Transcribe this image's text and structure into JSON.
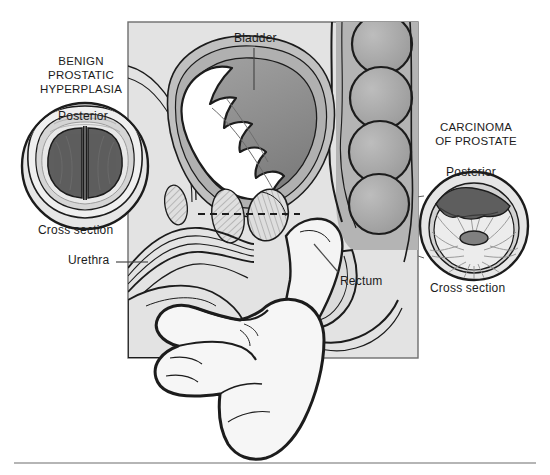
{
  "figure": {
    "background_color": "#ffffff",
    "panel_fill": "#e3e3e3",
    "panel_border_color": "#6e6e6e",
    "ink_color": "#1c1c1c",
    "tissue_mid_gray": "#a8a8a8",
    "tissue_dark_gray": "#6b6b6b",
    "lumen_white": "#ffffff",
    "hatch_gray": "#b9b9b9"
  },
  "labels": {
    "bph_title": "BENIGN\nPROSTATIC\nHYPERPLASIA",
    "carcinoma_title": "CARCINOMA\nOF PROSTATE",
    "bph_posterior": "Posterior",
    "carcinoma_posterior": "Posterior",
    "bph_cross_section": "Cross section",
    "carcinoma_cross_section": "Cross section",
    "bladder": "Bladder",
    "urethra": "Urethra",
    "rectum": "Rectum"
  },
  "insets": {
    "bph": {
      "name": "benign-prostatic-hyperplasia-cross-section",
      "center": [
        85,
        166
      ],
      "radius": 64,
      "description": "Symmetrically enlarged prostate with two bulky dark lateral lobes separated by a median furrow, compressing the urethra"
    },
    "carcinoma": {
      "name": "carcinoma-of-prostate-cross-section",
      "center": [
        474,
        226
      ],
      "radius": 55,
      "description": "Prostate with irregular dark tumor mass replacing the posterior lobe and radiating glandular stroma around a slit-like central urethra"
    }
  },
  "main_panel": {
    "name": "sagittal-male-pelvis",
    "bounds": [
      128,
      22,
      290,
      336
    ],
    "structures": [
      "bladder",
      "bladder-trabeculated-wall",
      "urethra",
      "prostate",
      "pubic-bone",
      "rectum",
      "sigmoid-colon",
      "examining-hand"
    ],
    "cross_section_plane": "dashed horizontal line through the prostate"
  }
}
